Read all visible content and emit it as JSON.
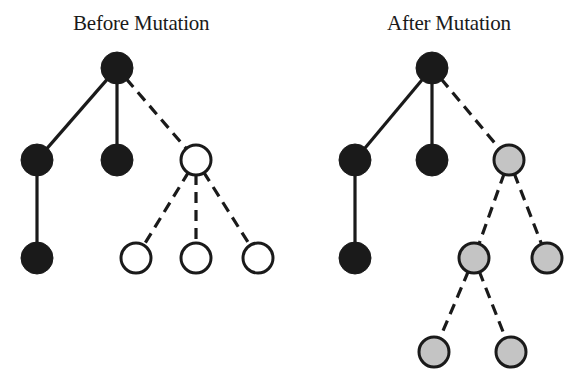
{
  "panels": [
    {
      "id": "before",
      "title": "Before Mutation",
      "nodes": [
        {
          "id": "b_root",
          "x": 117,
          "y": 68,
          "fill": "black"
        },
        {
          "id": "b_l1a",
          "x": 37,
          "y": 160,
          "fill": "black"
        },
        {
          "id": "b_l1b",
          "x": 117,
          "y": 160,
          "fill": "black"
        },
        {
          "id": "b_l1c",
          "x": 196,
          "y": 160,
          "fill": "white"
        },
        {
          "id": "b_l2a",
          "x": 37,
          "y": 258,
          "fill": "black"
        },
        {
          "id": "b_l2b",
          "x": 136,
          "y": 258,
          "fill": "white"
        },
        {
          "id": "b_l2c",
          "x": 196,
          "y": 258,
          "fill": "white"
        },
        {
          "id": "b_l2d",
          "x": 258,
          "y": 258,
          "fill": "white"
        }
      ],
      "edges": [
        {
          "from": "b_root",
          "to": "b_l1a",
          "style": "solid"
        },
        {
          "from": "b_root",
          "to": "b_l1b",
          "style": "solid"
        },
        {
          "from": "b_root",
          "to": "b_l1c",
          "style": "dashed"
        },
        {
          "from": "b_l1a",
          "to": "b_l2a",
          "style": "solid"
        },
        {
          "from": "b_l1c",
          "to": "b_l2b",
          "style": "dashed"
        },
        {
          "from": "b_l1c",
          "to": "b_l2c",
          "style": "dashed"
        },
        {
          "from": "b_l1c",
          "to": "b_l2d",
          "style": "dashed"
        }
      ]
    },
    {
      "id": "after",
      "title": "After Mutation",
      "nodes": [
        {
          "id": "a_root",
          "x": 432,
          "y": 68,
          "fill": "black"
        },
        {
          "id": "a_l1a",
          "x": 355,
          "y": 160,
          "fill": "black"
        },
        {
          "id": "a_l1b",
          "x": 432,
          "y": 160,
          "fill": "black"
        },
        {
          "id": "a_l1c",
          "x": 509,
          "y": 160,
          "fill": "gray"
        },
        {
          "id": "a_l2a",
          "x": 355,
          "y": 258,
          "fill": "black"
        },
        {
          "id": "a_l2b",
          "x": 474,
          "y": 258,
          "fill": "gray"
        },
        {
          "id": "a_l2c",
          "x": 547,
          "y": 258,
          "fill": "gray"
        },
        {
          "id": "a_l3a",
          "x": 434,
          "y": 352,
          "fill": "gray"
        },
        {
          "id": "a_l3b",
          "x": 511,
          "y": 352,
          "fill": "gray"
        }
      ],
      "edges": [
        {
          "from": "a_root",
          "to": "a_l1a",
          "style": "solid"
        },
        {
          "from": "a_root",
          "to": "a_l1b",
          "style": "solid"
        },
        {
          "from": "a_root",
          "to": "a_l1c",
          "style": "dashed"
        },
        {
          "from": "a_l1a",
          "to": "a_l2a",
          "style": "solid"
        },
        {
          "from": "a_l1c",
          "to": "a_l2b",
          "style": "dashed"
        },
        {
          "from": "a_l1c",
          "to": "a_l2c",
          "style": "dashed"
        },
        {
          "from": "a_l2b",
          "to": "a_l3a",
          "style": "dashed"
        },
        {
          "from": "a_l2b",
          "to": "a_l3b",
          "style": "dashed"
        }
      ]
    }
  ],
  "style": {
    "node_radius": 15,
    "stroke_color": "#1a1a1a",
    "fill_colors": {
      "black": "#1a1a1a",
      "white": "#ffffff",
      "gray": "#c4c4c4"
    },
    "edge_width": 3.2,
    "dash_pattern": "11 7"
  }
}
